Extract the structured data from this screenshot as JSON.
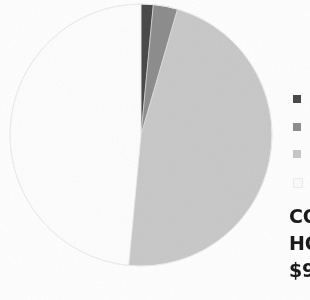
{
  "figure": {
    "kind": "pie-chart-scan",
    "background_color": "#fefefe"
  },
  "caption": {
    "lines": [
      {
        "id": "line-1",
        "text": "CO"
      },
      {
        "id": "line-2",
        "text": "HO"
      },
      {
        "id": "line-3",
        "text": "$9"
      }
    ]
  },
  "legend": {
    "position": "right",
    "entries": [
      {
        "label": "",
        "color": "#4a4a4a"
      },
      {
        "label": "",
        "color": "#8e8e8e"
      },
      {
        "label": "",
        "color": "#c9c9c9"
      },
      {
        "label": "",
        "color": "#f2f2f2"
      }
    ]
  },
  "chart_data": {
    "type": "pie",
    "title": "",
    "subtitle": "",
    "xlabel": "",
    "ylabel": "",
    "grid": false,
    "legend_position": "right",
    "start_angle_deg": 0,
    "direction": "clockwise",
    "labels": [
      "",
      "",
      "",
      ""
    ],
    "values": [
      1.5,
      3.0,
      47.0,
      48.5
    ],
    "colors": [
      "#4a4a4a",
      "#8e8e8e",
      "#c9c9c9",
      "#fdfdfd"
    ],
    "stroke_color": "#e3e3e3",
    "center": {
      "x": 132,
      "y": 132
    },
    "radius": 131,
    "annotations": []
  }
}
